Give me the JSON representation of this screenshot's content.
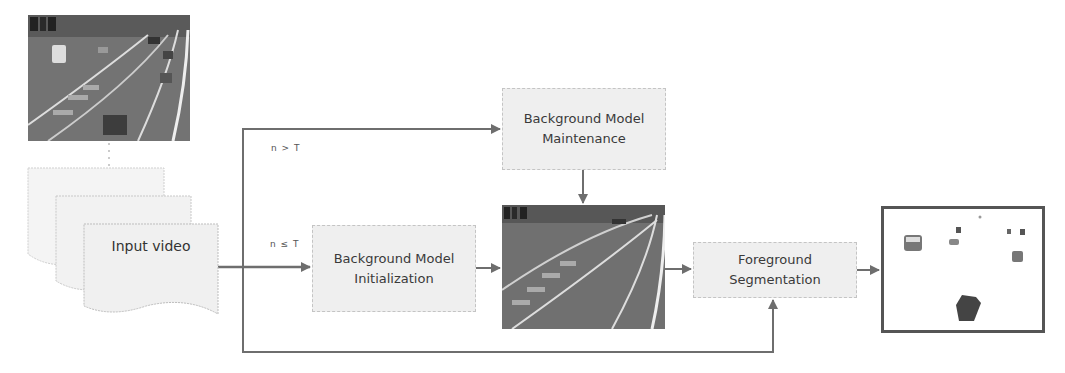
{
  "diagram": {
    "type": "flowchart",
    "nodes": {
      "input_frame_image": {
        "kind": "image",
        "description": "Traffic video frame (highway)"
      },
      "input_video": {
        "label": "Input video",
        "shape": "stacked-documents"
      },
      "bg_init": {
        "label_line1": "Background Model",
        "label_line2": "Initialization"
      },
      "bg_maint": {
        "label_line1": "Background Model",
        "label_line2": "Maintenance"
      },
      "background_image": {
        "kind": "image",
        "description": "Background model frame (empty highway)"
      },
      "fg_seg": {
        "label_line1": "Foreground",
        "label_line2": "Segmentation"
      },
      "output_image": {
        "kind": "image",
        "description": "Foreground mask with segmented vehicles"
      }
    },
    "edge_labels": {
      "maintenance_condition": "n > T",
      "init_condition": "n ≤ T"
    },
    "edges": [
      {
        "from": "input_frame_image",
        "to": "input_video",
        "style": "dotted"
      },
      {
        "from": "input_video",
        "to": "bg_init",
        "label": "n ≤ T"
      },
      {
        "from": "input_video",
        "to": "bg_maint",
        "label": "n > T"
      },
      {
        "from": "bg_init",
        "to": "background_image"
      },
      {
        "from": "bg_maint",
        "to": "background_image"
      },
      {
        "from": "background_image",
        "to": "fg_seg"
      },
      {
        "from": "input_video",
        "to": "fg_seg"
      },
      {
        "from": "fg_seg",
        "to": "output_image"
      }
    ],
    "colors": {
      "box_fill": "#efefef",
      "box_border": "#c4c4c4",
      "line": "#6e6e6e",
      "text": "#3a3a3a",
      "frame_border": "#555555"
    }
  }
}
